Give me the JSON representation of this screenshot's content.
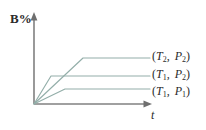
{
  "figure": {
    "width": 206,
    "height": 130,
    "background_color": "#ffffff",
    "axis_color": "#808080",
    "curve_color": "#93aea9",
    "text_color": "#2b2b2b"
  },
  "axes": {
    "y_label": "B%",
    "x_label": "t",
    "origin": {
      "x": 34,
      "y": 104
    },
    "y_axis_top": 12,
    "x_axis_right": 152
  },
  "curves": [
    {
      "id": "curve-T2-P2",
      "label_open": "(",
      "label_t_var": "T",
      "label_t_sub": "2",
      "label_comma": ",",
      "label_p_var": "P",
      "label_p_sub": "2",
      "label_close": ")",
      "label_text": "(T2 , P2)",
      "knee_x": 83,
      "plateau_y": 58,
      "end_x": 150
    },
    {
      "id": "curve-T1-P2",
      "label_open": "(",
      "label_t_var": "T",
      "label_t_sub": "1",
      "label_comma": ",",
      "label_p_var": "P",
      "label_p_sub": "2",
      "label_close": ")",
      "label_text": "(T1 , P2)",
      "knee_x": 51,
      "plateau_y": 76,
      "end_x": 150
    },
    {
      "id": "curve-T1-P1",
      "label_open": "(",
      "label_t_var": "T",
      "label_t_sub": "1",
      "label_comma": ",",
      "label_p_var": "P",
      "label_p_sub": "1",
      "label_close": ")",
      "label_text": "(T1 , P1)",
      "knee_x": 65,
      "plateau_y": 89,
      "end_x": 150
    }
  ],
  "chart_data": {
    "type": "line",
    "title": "",
    "xlabel": "t",
    "ylabel": "B%",
    "grid": false,
    "legend_position": "right-inline",
    "xlim": [
      0,
      118
    ],
    "ylim": [
      0,
      92
    ],
    "annotations": [
      "(T2 , P2)",
      "(T1 , P2)",
      "(T1 , P1)"
    ],
    "series": [
      {
        "name": "(T2 , P2)",
        "x": [
          0,
          49,
          116
        ],
        "y": [
          0,
          46,
          46
        ],
        "note": "highest equilibrium conversion, reached slowest"
      },
      {
        "name": "(T1 , P2)",
        "x": [
          0,
          17,
          116
        ],
        "y": [
          0,
          28,
          28
        ],
        "note": "intermediate plateau, reached fastest"
      },
      {
        "name": "(T1 , P1)",
        "x": [
          0,
          31,
          116
        ],
        "y": [
          0,
          15,
          15
        ],
        "note": "lowest equilibrium conversion"
      }
    ]
  }
}
